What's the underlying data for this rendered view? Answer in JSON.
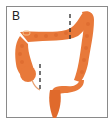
{
  "figure": {
    "panel_label": "B",
    "colors": {
      "colon": "#e8793a",
      "colon_shade": "#d8652a",
      "highlight": "#f4c08a",
      "marker": "#2a2a2a",
      "border": "#8a8a8a"
    },
    "markers": [
      {
        "name": "transverse-colon-marker",
        "style": "dashed-line"
      },
      {
        "name": "cecum-marker",
        "style": "dashed-line"
      }
    ]
  }
}
